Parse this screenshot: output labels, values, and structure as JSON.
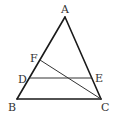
{
  "diagram": {
    "type": "triangle-geometry",
    "points": {
      "A": {
        "label": "A"
      },
      "B": {
        "label": "B"
      },
      "C": {
        "label": "C"
      },
      "D": {
        "label": "D"
      },
      "E": {
        "label": "E"
      },
      "F": {
        "label": "F"
      }
    },
    "segments": [
      {
        "from": "A",
        "to": "B"
      },
      {
        "from": "A",
        "to": "C"
      },
      {
        "from": "B",
        "to": "C"
      },
      {
        "from": "D",
        "to": "E"
      },
      {
        "from": "F",
        "to": "C"
      }
    ],
    "relations": {
      "D_on": "AB",
      "F_on": "AB",
      "E_on": "AC",
      "DE_parallel_to": "BC"
    }
  }
}
